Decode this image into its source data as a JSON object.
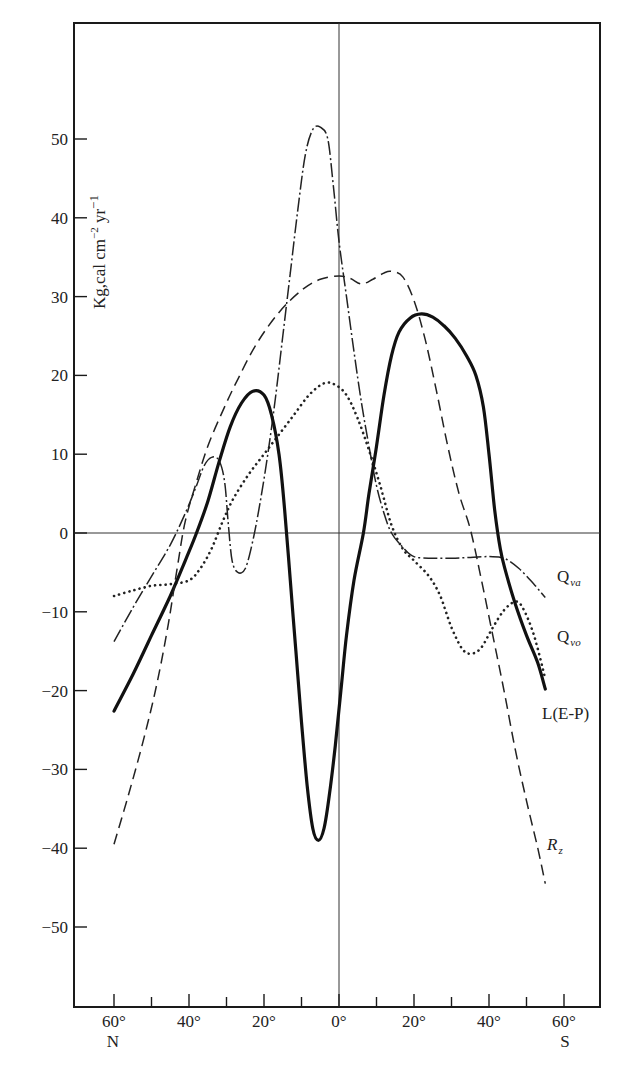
{
  "chart_data": {
    "type": "line",
    "title": "",
    "xlabel": "",
    "ylabel": "Kg,cal cm⁻² yr⁻¹",
    "ylabel_text": "Kg,cal cm",
    "ylabel_sup1": "−2",
    "ylabel_mid": " yr",
    "ylabel_sup2": "−1",
    "x_convention": "latitude in degrees; negative = North, positive = South",
    "xlim": [
      -70,
      70
    ],
    "ylim": [
      -60,
      57
    ],
    "grid": false,
    "x_ticks": [
      {
        "value": -60,
        "label": "60°",
        "major": true
      },
      {
        "value": -50,
        "label": "",
        "major": false
      },
      {
        "value": -40,
        "label": "40°",
        "major": true
      },
      {
        "value": -30,
        "label": "",
        "major": false
      },
      {
        "value": -20,
        "label": "20°",
        "major": true
      },
      {
        "value": -10,
        "label": "",
        "major": false
      },
      {
        "value": 0,
        "label": "0°",
        "major": true
      },
      {
        "value": 10,
        "label": "",
        "major": false
      },
      {
        "value": 20,
        "label": "20°",
        "major": true
      },
      {
        "value": 30,
        "label": "",
        "major": false
      },
      {
        "value": 40,
        "label": "40°",
        "major": true
      },
      {
        "value": 50,
        "label": "",
        "major": false
      },
      {
        "value": 60,
        "label": "60°",
        "major": true
      }
    ],
    "x_hemisphere_labels": {
      "north": "N",
      "south": "S"
    },
    "y_ticks": [
      50,
      40,
      30,
      20,
      10,
      0,
      -10,
      -20,
      -30,
      -40,
      -50
    ],
    "y_tick_labels": [
      "50",
      "40",
      "30",
      "20",
      "10",
      "0",
      "−10",
      "−20",
      "−30",
      "−40",
      "−50"
    ],
    "series": [
      {
        "name": "Q_va",
        "label_main": "Q",
        "label_sub": "va",
        "style": "dash-dot",
        "label_pos": [
          -999,
          0
        ],
        "points": [
          [
            -60,
            -13.8
          ],
          [
            -55,
            -9.5
          ],
          [
            -50,
            -5.5
          ],
          [
            -45,
            -1.5
          ],
          [
            -41,
            2.5
          ],
          [
            -38,
            6
          ],
          [
            -36,
            8.5
          ],
          [
            -34,
            9.6
          ],
          [
            -32,
            9.2
          ],
          [
            -30.5,
            6.5
          ],
          [
            -29.5,
            1
          ],
          [
            -28.5,
            -3.5
          ],
          [
            -27,
            -5
          ],
          [
            -25,
            -4.5
          ],
          [
            -23,
            -1
          ],
          [
            -21,
            4
          ],
          [
            -19,
            10
          ],
          [
            -17,
            17
          ],
          [
            -15,
            25
          ],
          [
            -13,
            33
          ],
          [
            -11,
            41
          ],
          [
            -9,
            48
          ],
          [
            -7,
            51.2
          ],
          [
            -5,
            51.5
          ],
          [
            -3,
            50
          ],
          [
            -1.5,
            44
          ],
          [
            0,
            37
          ],
          [
            2,
            30
          ],
          [
            4,
            23
          ],
          [
            6,
            16.5
          ],
          [
            8,
            11
          ],
          [
            10,
            6
          ],
          [
            12,
            2.5
          ],
          [
            14,
            0
          ],
          [
            17,
            -1.8
          ],
          [
            20,
            -3
          ],
          [
            25,
            -3.2
          ],
          [
            30,
            -3.2
          ],
          [
            35,
            -3.1
          ],
          [
            40,
            -3
          ],
          [
            44,
            -3.2
          ],
          [
            48,
            -4.5
          ],
          [
            52,
            -6.5
          ],
          [
            55,
            -8.2
          ]
        ]
      },
      {
        "name": "Q_vo",
        "label_main": "Q",
        "label_sub": "vo",
        "style": "dotted",
        "points": [
          [
            -60,
            -8
          ],
          [
            -55,
            -7.3
          ],
          [
            -50,
            -6.7
          ],
          [
            -45,
            -6.5
          ],
          [
            -40,
            -6
          ],
          [
            -37,
            -4.5
          ],
          [
            -34,
            -2
          ],
          [
            -31,
            1.5
          ],
          [
            -28,
            4.5
          ],
          [
            -24,
            7.5
          ],
          [
            -20,
            10
          ],
          [
            -16,
            12.5
          ],
          [
            -12,
            15
          ],
          [
            -8,
            17.5
          ],
          [
            -4,
            19
          ],
          [
            -1,
            18.8
          ],
          [
            2,
            17.5
          ],
          [
            5,
            14.5
          ],
          [
            8,
            10.5
          ],
          [
            11,
            6
          ],
          [
            14,
            1
          ],
          [
            17,
            -2
          ],
          [
            20,
            -3.5
          ],
          [
            24,
            -5.5
          ],
          [
            27,
            -8
          ],
          [
            30,
            -12
          ],
          [
            33,
            -14.8
          ],
          [
            35.5,
            -15.3
          ],
          [
            38,
            -14.5
          ],
          [
            41,
            -12
          ],
          [
            44,
            -9.8
          ],
          [
            47,
            -8.7
          ],
          [
            49,
            -9.5
          ],
          [
            52,
            -13
          ],
          [
            55,
            -18.5
          ]
        ]
      },
      {
        "name": "L(E-P)",
        "label_main": "L(E-P)",
        "label_sub": "",
        "style": "solid-thick",
        "points": [
          [
            -60,
            -22.6
          ],
          [
            -55,
            -18
          ],
          [
            -50,
            -13
          ],
          [
            -45,
            -8
          ],
          [
            -41,
            -3.5
          ],
          [
            -38,
            0
          ],
          [
            -35,
            4
          ],
          [
            -32,
            9
          ],
          [
            -29,
            13.5
          ],
          [
            -26,
            16.5
          ],
          [
            -23,
            18
          ],
          [
            -20,
            17.5
          ],
          [
            -18,
            15
          ],
          [
            -16,
            10
          ],
          [
            -14.5,
            3
          ],
          [
            -13,
            -6
          ],
          [
            -11.5,
            -15
          ],
          [
            -10,
            -24
          ],
          [
            -8.5,
            -32
          ],
          [
            -7,
            -37.5
          ],
          [
            -5.5,
            -39
          ],
          [
            -4,
            -37.5
          ],
          [
            -2.5,
            -33
          ],
          [
            -1,
            -27
          ],
          [
            0.5,
            -20
          ],
          [
            2,
            -13
          ],
          [
            4,
            -6
          ],
          [
            6.5,
            0
          ],
          [
            8,
            5
          ],
          [
            10,
            11
          ],
          [
            12,
            17.5
          ],
          [
            14,
            22.5
          ],
          [
            16,
            25.5
          ],
          [
            19,
            27.3
          ],
          [
            22,
            27.8
          ],
          [
            25,
            27.4
          ],
          [
            28,
            26.3
          ],
          [
            31,
            24.7
          ],
          [
            34,
            22.5
          ],
          [
            36.5,
            20
          ],
          [
            38.5,
            16
          ],
          [
            40,
            10
          ],
          [
            41.5,
            3
          ],
          [
            43,
            -2
          ],
          [
            44.5,
            -5
          ],
          [
            47,
            -9
          ],
          [
            50,
            -13
          ],
          [
            53,
            -16.5
          ],
          [
            55,
            -19.8
          ]
        ]
      },
      {
        "name": "R_z",
        "label_main": "R",
        "label_sub": "z",
        "style": "dashed",
        "points": [
          [
            -60,
            -39.5
          ],
          [
            -56,
            -33
          ],
          [
            -52,
            -26
          ],
          [
            -48.5,
            -19
          ],
          [
            -45.5,
            -11.5
          ],
          [
            -43,
            -4
          ],
          [
            -41,
            1.5
          ],
          [
            -38,
            6.5
          ],
          [
            -35,
            11
          ],
          [
            -31,
            15.5
          ],
          [
            -27,
            19.5
          ],
          [
            -22,
            24
          ],
          [
            -16,
            28
          ],
          [
            -10,
            30.8
          ],
          [
            -5,
            32.2
          ],
          [
            0,
            32.6
          ],
          [
            3,
            32.3
          ],
          [
            6,
            31.6
          ],
          [
            9,
            32.2
          ],
          [
            12,
            33
          ],
          [
            14,
            33.2
          ],
          [
            17,
            32.5
          ],
          [
            20,
            29.5
          ],
          [
            23,
            24.5
          ],
          [
            26,
            18
          ],
          [
            29,
            11
          ],
          [
            32,
            5
          ],
          [
            35,
            0.5
          ],
          [
            38,
            -6
          ],
          [
            41,
            -13
          ],
          [
            44,
            -20
          ],
          [
            47,
            -27.5
          ],
          [
            50,
            -34
          ],
          [
            53,
            -40
          ],
          [
            55,
            -44.5
          ]
        ]
      }
    ],
    "annotations": [
      {
        "text": "Q_va",
        "near_series": "Q_va"
      },
      {
        "text": "Q_vo",
        "near_series": "Q_vo"
      },
      {
        "text": "L(E-P)",
        "near_series": "L(E-P)"
      },
      {
        "text": "R_z",
        "near_series": "R_z"
      }
    ]
  }
}
